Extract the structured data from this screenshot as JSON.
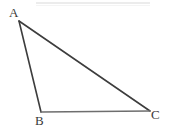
{
  "figure": {
    "type": "geometry-diagram",
    "shape": "triangle",
    "background_color": "#ffffff",
    "stroke_color": "#3d3d3d",
    "stroke_color_base": "#6e6e6e",
    "label_color": "#3a3a3a",
    "artifact_color": "#ececec",
    "canvas": {
      "width": 171,
      "height": 136
    },
    "vertices": [
      {
        "name": "A",
        "label": "A",
        "x": 19,
        "y": 21
      },
      {
        "name": "B",
        "label": "B",
        "x": 41,
        "y": 112
      },
      {
        "name": "C",
        "label": "C",
        "x": 150,
        "y": 111
      }
    ],
    "edges": [
      {
        "name": "AB",
        "from": "A",
        "to": "B",
        "stroke_width": 1.6
      },
      {
        "name": "AC",
        "from": "A",
        "to": "C",
        "stroke_width": 1.6
      },
      {
        "name": "BC",
        "from": "B",
        "to": "C",
        "stroke_width": 1.3
      }
    ],
    "labels": {
      "a": "A",
      "b": "B",
      "c": "C"
    }
  }
}
